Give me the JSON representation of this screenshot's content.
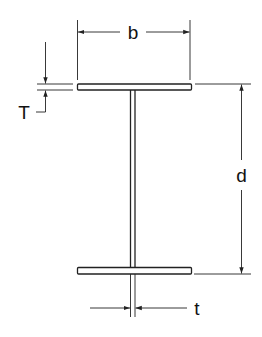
{
  "diagram": {
    "labels": {
      "flange_width": "b",
      "flange_thickness": "T",
      "depth": "d",
      "web_thickness": "t"
    },
    "colors": {
      "stroke": "#222222",
      "background": "#ffffff"
    }
  }
}
